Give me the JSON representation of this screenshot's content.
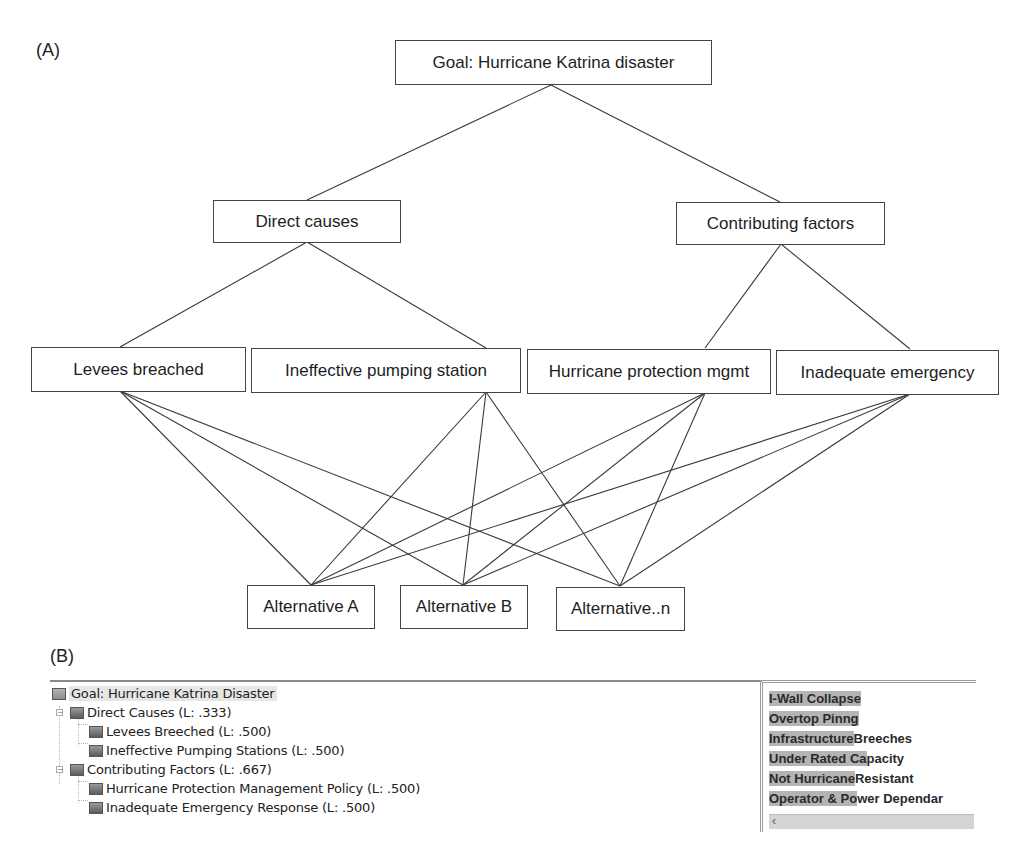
{
  "panel_a": {
    "label": "(A)"
  },
  "panel_b": {
    "label": "(B)"
  },
  "hierarchy": {
    "goal": {
      "label": "Goal: Hurricane Katrina disaster"
    },
    "criteria": [
      {
        "label": "Direct causes"
      },
      {
        "label": "Contributing factors"
      }
    ],
    "subcriteria": [
      {
        "label": "Levees breached",
        "parent": "Direct causes"
      },
      {
        "label": "Ineffective pumping station",
        "parent": "Direct causes"
      },
      {
        "label": "Hurricane protection mgmt",
        "parent": "Contributing factors"
      },
      {
        "label": "Inadequate emergency",
        "parent": "Contributing factors"
      }
    ],
    "alternatives": [
      {
        "label": "Alternative A"
      },
      {
        "label": "Alternative B"
      },
      {
        "label": "Alternative..n"
      }
    ]
  },
  "tree": {
    "root": {
      "label": "Goal: Hurricane Katrina Disaster"
    },
    "nodes": [
      {
        "label": "Direct Causes (L: .333)",
        "children": [
          {
            "label": "Levees Breeched (L: .500)"
          },
          {
            "label": "Ineffective Pumping Stations (L: .500)"
          }
        ]
      },
      {
        "label": "Contributing Factors (L: .667)",
        "children": [
          {
            "label": "Hurricane Protection Management Policy (L: .500)"
          },
          {
            "label": "Inadequate Emergency Response (L: .500)"
          }
        ]
      }
    ],
    "expander_symbol": "−"
  },
  "list": {
    "items": [
      {
        "highlight": "I-Wall Collapse",
        "rest": ""
      },
      {
        "highlight": "Overtop Pinng",
        "rest": ""
      },
      {
        "highlight": "Infrastructure",
        "rest": " Breeches"
      },
      {
        "highlight": "Under Rated Ca",
        "rest": "pacity"
      },
      {
        "highlight": "Not Hurricane",
        "rest": " Resistant"
      },
      {
        "highlight": "Operator & Po",
        "rest": "wer Dependar"
      }
    ],
    "scroll_left_icon": "‹"
  },
  "colors": {
    "line": "#3a3a3a",
    "box_border": "#444444",
    "highlight": "#b4b4b4"
  }
}
